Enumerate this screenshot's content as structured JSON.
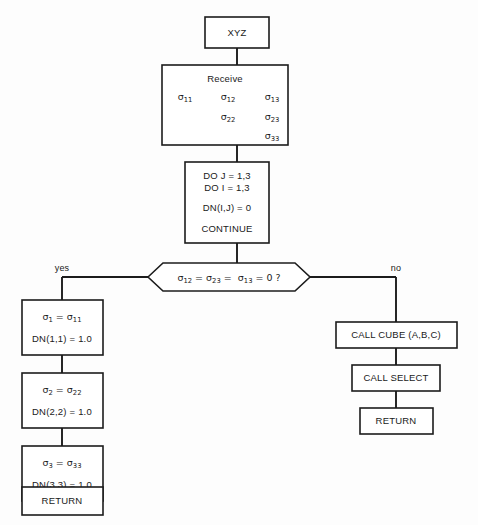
{
  "diagram": {
    "background_color": "#fdfdfd",
    "line_color": "#1c1c1c",
    "text_color": "#1a1a1a",
    "nodes": {
      "start": {
        "label": "XYZ",
        "shape": "rectangle"
      },
      "receive": {
        "heading": "Receive",
        "shape": "rectangle",
        "matrix": [
          [
            {
              "symbol": "σ",
              "sub": "11"
            },
            {
              "symbol": "σ",
              "sub": "12"
            },
            {
              "symbol": "σ",
              "sub": "13"
            }
          ],
          [
            {
              "symbol": "",
              "sub": ""
            },
            {
              "symbol": "σ",
              "sub": "22"
            },
            {
              "symbol": "σ",
              "sub": "23"
            }
          ],
          [
            {
              "symbol": "",
              "sub": ""
            },
            {
              "symbol": "",
              "sub": ""
            },
            {
              "symbol": "σ",
              "sub": "33"
            }
          ]
        ]
      },
      "loop": {
        "shape": "rectangle",
        "lines": [
          "DO J = 1,3",
          "DO I = 1,3",
          "DN(I,J) = 0",
          "CONTINUE"
        ]
      },
      "decision": {
        "shape": "hexagon",
        "parts": [
          {
            "symbol": "σ",
            "sub": "12"
          },
          {
            "op": "="
          },
          {
            "symbol": "σ",
            "sub": "23"
          },
          {
            "op": "="
          },
          {
            "symbol": "σ",
            "sub": "13"
          },
          {
            "op": "= 0 ?"
          }
        ],
        "plain_text": "σ₁₂ = σ₂₃ = σ₁₃ = 0 ?"
      },
      "yes_branch_label": "yes",
      "no_branch_label": "no",
      "assign1": {
        "shape": "rectangle",
        "symbol": "σ",
        "sub": "1",
        "rhs_symbol": "σ",
        "rhs_sub": "11",
        "second_line": "DN(1,1) = 1.0"
      },
      "assign2": {
        "shape": "rectangle",
        "symbol": "σ",
        "sub": "2",
        "rhs_symbol": "σ",
        "rhs_sub": "22",
        "second_line": "DN(2,2) = 1.0"
      },
      "assign3": {
        "shape": "rectangle",
        "symbol": "σ",
        "sub": "3",
        "rhs_symbol": "σ",
        "rhs_sub": "33",
        "second_line": "DN(3,3) = 1.0"
      },
      "return_left": {
        "label": "RETURN",
        "shape": "rectangle"
      },
      "call_cube": {
        "label": "CALL CUBE (A,B,C)",
        "shape": "rectangle"
      },
      "call_select": {
        "label": "CALL SELECT",
        "shape": "rectangle"
      },
      "return_right": {
        "label": "RETURN",
        "shape": "rectangle"
      }
    }
  }
}
